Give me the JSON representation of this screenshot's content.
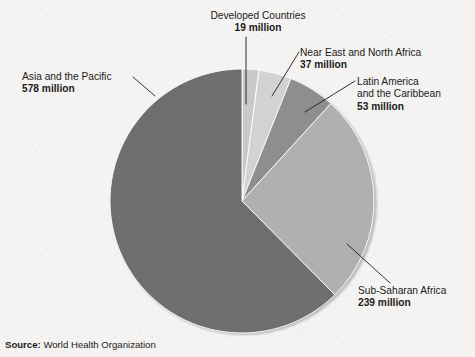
{
  "chart_data": {
    "type": "pie",
    "title": "",
    "unit": "million",
    "total": 926,
    "categories": [
      "Developed Countries",
      "Near East and North Africa",
      "Latin America and the Caribbean",
      "Sub-Saharan Africa",
      "Asia and the Pacific"
    ],
    "values": [
      19,
      37,
      53,
      239,
      578
    ],
    "value_labels": [
      "19 million",
      "37 million",
      "53 million",
      "239 million",
      "578 million"
    ],
    "colors": [
      "#c9c9c7",
      "#d2d2d0",
      "#8e8e8c",
      "#b0b0ae",
      "#6e6e6c"
    ],
    "start_angle_deg": 0,
    "direction": "clockwise",
    "legend": "callout-labels",
    "grid": false,
    "slices": [
      {
        "label": "Developed Countries",
        "value": 19,
        "value_label": "19 million",
        "color": "#c9c9c7",
        "angle_deg": 7.4
      },
      {
        "label": "Near East and North Africa",
        "value": 37,
        "value_label": "37 million",
        "color": "#d2d2d0",
        "angle_deg": 14.4
      },
      {
        "label": "Latin America and the Caribbean",
        "value": 53,
        "value_label": "53 million",
        "color": "#8e8e8c",
        "angle_deg": 20.6
      },
      {
        "label": "Sub-Saharan Africa",
        "value": 239,
        "value_label": "239 million",
        "color": "#b0b0ae",
        "angle_deg": 92.9
      },
      {
        "label": "Asia and the Pacific",
        "value": 578,
        "value_label": "578 million",
        "color": "#6e6e6c",
        "angle_deg": 224.7
      }
    ]
  },
  "callouts": {
    "developed": {
      "line1": "Developed Countries",
      "line2": "",
      "value": "19 million"
    },
    "near_east": {
      "line1": "Near East and North Africa",
      "line2": "",
      "value": "37 million"
    },
    "latin": {
      "line1": "Latin America",
      "line2": "and the Caribbean",
      "value": "53 million"
    },
    "asia": {
      "line1": "Asia and the Pacific",
      "line2": "",
      "value": "578 million"
    },
    "subsaharan": {
      "line1": "Sub-Saharan Africa",
      "line2": "",
      "value": "239 million"
    }
  },
  "source": {
    "label": "Source:",
    "value": "World Health Organization"
  }
}
